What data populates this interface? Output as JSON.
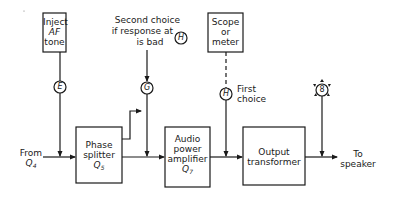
{
  "diagram": {
    "type": "block-diagram",
    "blocks": {
      "inject_af": {
        "line1": "Inject",
        "line2": "AF",
        "line3": "tone"
      },
      "scope": {
        "line1": "Scope",
        "line2": "or",
        "line3": "meter"
      },
      "phase_splitter": {
        "line1": "Phase",
        "line2": "splitter",
        "line3": "Q",
        "sub": "5"
      },
      "audio_amp": {
        "line1": "Audio",
        "line2": "power",
        "line3": "amplifier",
        "line4": "Q",
        "sub": "7"
      },
      "output_transformer": {
        "line1": "Output",
        "line2": "transformer"
      }
    },
    "test_points": {
      "e": "E",
      "g": "G",
      "h_top": "H",
      "h_mid": "H",
      "speaker": "8"
    },
    "annotations": {
      "second_choice_line1": "Second choice",
      "second_choice_line2": "if response at",
      "second_choice_line3": "is bad",
      "first_choice_line1": "First",
      "first_choice_line2": "choice",
      "from_line1": "From",
      "from_line2": "Q",
      "from_sub": "4",
      "to_line1": "To",
      "to_line2": "speaker"
    },
    "colors": {
      "line": "#1a1a1a",
      "background": "#ffffff"
    }
  }
}
